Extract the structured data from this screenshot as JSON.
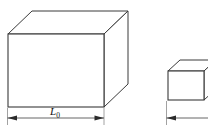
{
  "figure": {
    "background_color": "#ffffff",
    "line_color": "#3a3a3a",
    "dim_line_color": "#555555",
    "text_color": "#111111",
    "width": 208,
    "height": 135
  },
  "shapes": {
    "left_box": {
      "name": "undeformed-block",
      "projection": "cabinet",
      "front_face": {
        "top_left": [
          8,
          34
        ],
        "top_right": [
          104,
          34
        ],
        "bottom_right": [
          104,
          107
        ],
        "bottom_left": [
          8,
          107
        ]
      },
      "depth_offset": [
        24,
        -23
      ],
      "visible_faces": [
        "front",
        "top",
        "right"
      ]
    },
    "right_box": {
      "name": "compressed-block",
      "projection": "cabinet",
      "front_face": {
        "top_left": [
          168,
          71
        ],
        "top_right": [
          208,
          71
        ],
        "bottom_right": [
          208,
          100
        ],
        "bottom_left": [
          168,
          100
        ]
      },
      "depth_offset": [
        24,
        -23
      ],
      "visible_faces": [
        "front",
        "top",
        "right"
      ],
      "clipped": "right edge of figure"
    }
  },
  "dimensions": {
    "left": {
      "label_main": "L",
      "label_subscript": "0",
      "label_full": "L0",
      "line_y": 118,
      "x_start": 7,
      "x_end": 104,
      "extension_top": 108,
      "arrow_style": "filled-triangle-both-ends"
    },
    "right": {
      "label_main": "",
      "label_subscript": "",
      "label_full": "",
      "line_y": 118,
      "x_start": 166,
      "x_end": 208,
      "extension_top": 101,
      "arrow_style": "filled-triangle-left-end"
    }
  }
}
